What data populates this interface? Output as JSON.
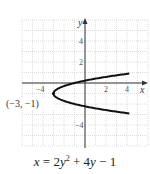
{
  "chart_data": {
    "type": "line",
    "title": "",
    "equation": "x = 2y^2 + 4y - 1",
    "xlabel": "x",
    "ylabel": "y",
    "xlim": [
      -6,
      6
    ],
    "ylim": [
      -6,
      6
    ],
    "grid": true,
    "x_ticks_labeled": [
      -4,
      2,
      4
    ],
    "y_ticks_labeled": [
      4,
      2,
      -4
    ],
    "vertex": {
      "x": -3,
      "y": -1,
      "label": "(−3, −1)"
    },
    "curve": "parabola opening right, x = 2y^2 + 4y - 1"
  },
  "labels": {
    "x_axis": "x",
    "y_axis": "y",
    "tick_x_neg4": "−4",
    "tick_x_2": "2",
    "tick_x_4": "4",
    "tick_y_4": "4",
    "tick_y_2": "2",
    "tick_y_neg4": "−4",
    "vertex": "(−3, −1)"
  },
  "caption": {
    "lhs": "x",
    "eq": " = 2",
    "y1": "y",
    "exp": "2",
    "mid": " + 4",
    "y2": "y",
    "tail": " − 1"
  }
}
